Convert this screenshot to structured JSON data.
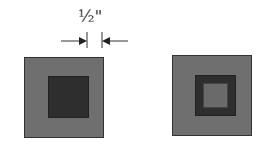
{
  "dimension": {
    "label": "½\"",
    "label_parts": {
      "fraction": "½",
      "unit": "\""
    }
  },
  "colors": {
    "outer_fill": "#6f6f6f",
    "dark_fill": "#2e2e2e",
    "inner_fill": "#6a6a6a",
    "line": "#333333"
  },
  "figures": [
    {
      "name": "left-square",
      "description": "gray square with dark square center"
    },
    {
      "name": "right-square",
      "description": "gray square with dark square frame and gray center"
    }
  ]
}
